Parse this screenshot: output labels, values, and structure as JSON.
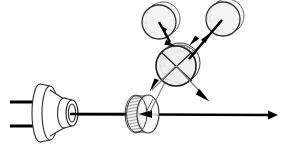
{
  "diagram": {
    "type": "optics-ray-diagram",
    "canvas": {
      "width": 281,
      "height": 151,
      "background": "#ffffff"
    },
    "colors": {
      "stroke_dark": "#111111",
      "stroke_mid": "#444444",
      "stroke_gray": "#777777",
      "disc_fill": "#f2f2f2",
      "disc_fill_light": "#f7f7f7",
      "hatch": "#555555",
      "beam_main": "#000000",
      "beam_secondary": "#808080",
      "background": "#ffffff"
    },
    "components": [
      {
        "id": "laser-source",
        "label": "Laser diode source",
        "shape": "cone-with-lens",
        "cx": 57,
        "cy": 113,
        "leads": 2
      },
      {
        "id": "beam-splitter-lower",
        "label": "Lower beam splitter disc",
        "shape": "tilted-disc",
        "cx": 145,
        "cy": 114,
        "rx": 11,
        "ry": 19
      },
      {
        "id": "crossed-element-center",
        "label": "Central crossed optical element",
        "shape": "circle-with-cross",
        "cx": 176,
        "cy": 65,
        "r": 20
      },
      {
        "id": "mirror-upper-left",
        "label": "Upper left mirror disc",
        "shape": "disc-3d",
        "cx": 160,
        "cy": 21,
        "r": 17
      },
      {
        "id": "mirror-upper-right",
        "label": "Upper right mirror disc",
        "shape": "disc-3d",
        "cx": 223,
        "cy": 18,
        "r": 17
      }
    ],
    "beams": [
      {
        "id": "beam-main-horizontal",
        "label": "Main horizontal beam",
        "from": [
          80,
          114
        ],
        "to": [
          272,
          115
        ],
        "weight": "thick",
        "arrow": "end",
        "color": "#000000"
      },
      {
        "id": "beam-splitter-to-center",
        "label": "Reflected beam to central element",
        "from": [
          152,
          112
        ],
        "to": [
          168,
          75
        ],
        "weight": "thin",
        "arrow": "end",
        "color": "#808080"
      },
      {
        "id": "beam-center-to-upper-left",
        "label": "Beam between center and upper-left mirror",
        "from": [
          168,
          30
        ],
        "to": [
          176,
          50
        ],
        "weight": "thick",
        "arrow": "end",
        "color": "#000000"
      },
      {
        "id": "beam-center-to-upper-right",
        "label": "Beam between center and upper-right mirror",
        "from": [
          214,
          24
        ],
        "to": [
          186,
          58
        ],
        "weight": "thick",
        "arrow": "start",
        "color": "#000000"
      },
      {
        "id": "beam-center-exit-lower-left",
        "label": "Exit beam lower-left from center",
        "from": [
          176,
          65
        ],
        "to": [
          150,
          91
        ],
        "weight": "thin",
        "arrow": "end",
        "color": "#808080"
      },
      {
        "id": "beam-center-exit-lower-right",
        "label": "Exit beam lower-right from center",
        "from": [
          176,
          65
        ],
        "to": [
          208,
          100
        ],
        "weight": "thin",
        "arrow": "end",
        "color": "#808080"
      }
    ],
    "leads": [
      {
        "id": "lead-top",
        "from": [
          10,
          102
        ],
        "to": [
          36,
          102
        ]
      },
      {
        "id": "lead-bottom",
        "from": [
          10,
          126
        ],
        "to": [
          36,
          126
        ]
      }
    ]
  }
}
